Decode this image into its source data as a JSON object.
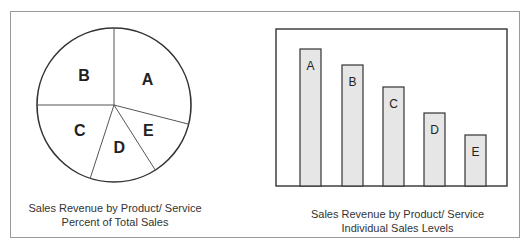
{
  "chart_data": [
    {
      "type": "pie",
      "title": "Sales Revenue by Product/ Service",
      "subtitle": "Percent of Total Sales",
      "categories": [
        "A",
        "B",
        "C",
        "D",
        "E"
      ],
      "values": [
        29,
        25,
        20,
        14,
        12
      ],
      "legend": "none",
      "labels_inside": true
    },
    {
      "type": "bar",
      "title": "Sales Revenue by Product/ Service",
      "subtitle": "Individual Sales Levels",
      "categories": [
        "A",
        "B",
        "C",
        "D",
        "E"
      ],
      "values": [
        137,
        121,
        99,
        73,
        51
      ],
      "xlabel": "",
      "ylabel": "",
      "grid": false,
      "axis_ticks": false,
      "bar_color": "#e6e6e6",
      "labels_inside": true
    }
  ],
  "pie": {
    "caption_line1": "Sales Revenue by Product/ Service",
    "caption_line2": "Percent of Total Sales"
  },
  "bar": {
    "caption_line1": "Sales Revenue by Product/ Service",
    "caption_line2": "Individual Sales Levels"
  }
}
